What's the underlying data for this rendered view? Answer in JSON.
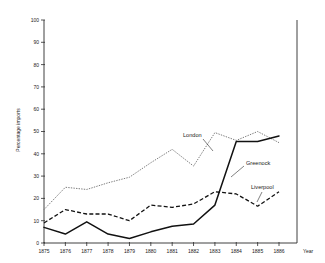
{
  "chart_data": {
    "type": "line",
    "title": "",
    "xlabel": "Year",
    "ylabel": "Percentage imports",
    "x": [
      1875,
      1876,
      1877,
      1878,
      1879,
      1880,
      1881,
      1882,
      1883,
      1884,
      1885,
      1886
    ],
    "xtick_labels": [
      "1875",
      "1876",
      "1877",
      "1878",
      "1879",
      "1880",
      "1881",
      "1882",
      "1883",
      "1884",
      "1885",
      "1886"
    ],
    "ytick_labels": [
      "0",
      "10",
      "20",
      "30",
      "40",
      "50",
      "60",
      "70",
      "80",
      "90",
      "100"
    ],
    "yticks": [
      0,
      10,
      20,
      30,
      40,
      50,
      60,
      70,
      80,
      90,
      100
    ],
    "ylim": [
      0,
      100
    ],
    "xlim": [
      1875,
      1886
    ],
    "grid": false,
    "legend_position": "inline-annotations",
    "series": [
      {
        "name": "London",
        "style": "dotted",
        "color": "#6d6d6d",
        "values": [
          15,
          25,
          24,
          27,
          29.5,
          36,
          42,
          34.5,
          49.5,
          46,
          50,
          45
        ]
      },
      {
        "name": "Liverpool",
        "style": "dashed",
        "color": "#111111",
        "values": [
          9,
          15,
          13,
          13,
          10,
          17,
          16,
          17.5,
          23,
          22,
          16.5,
          23
        ]
      },
      {
        "name": "Greenock",
        "style": "solid",
        "color": "#111111",
        "values": [
          7,
          4,
          9.5,
          4,
          2,
          5,
          7.5,
          8.5,
          17,
          45.5,
          45.5,
          48
        ]
      }
    ],
    "annotations": [
      {
        "text": "London",
        "series": "London"
      },
      {
        "text": "Greenock",
        "series": "Greenock"
      },
      {
        "text": "Liverpool",
        "series": "Liverpool"
      }
    ]
  }
}
